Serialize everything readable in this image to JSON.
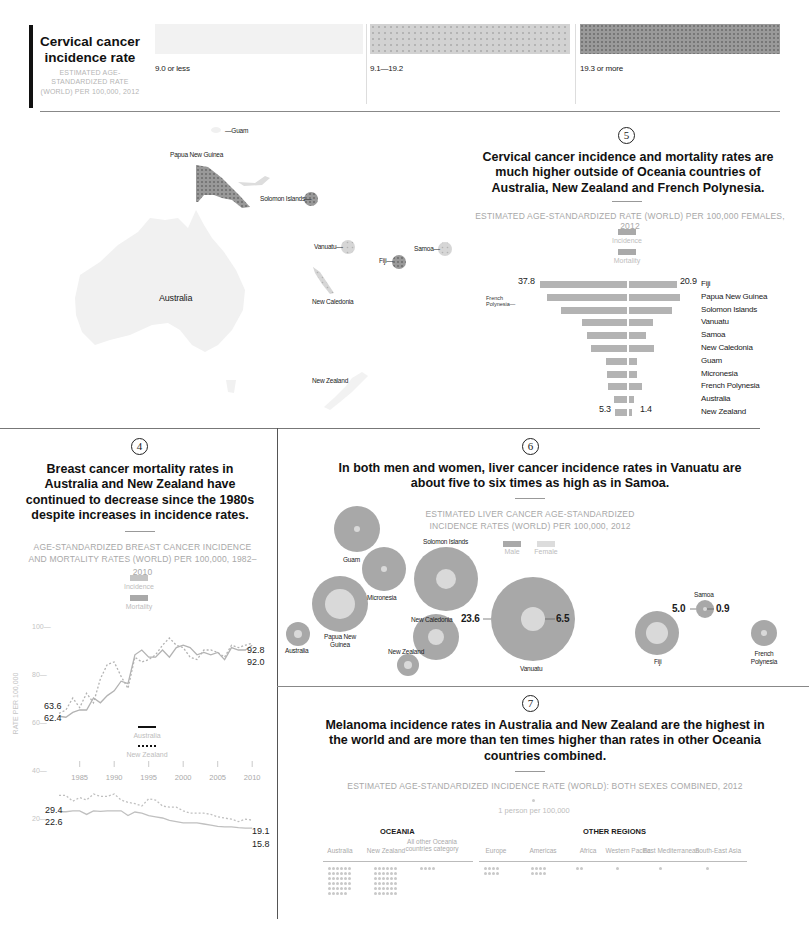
{
  "legend_top": {
    "title": "Cervical cancer incidence rate",
    "subtitle": "ESTIMATED AGE-STANDARDIZED RATE (WORLD) PER 100,000, 2012",
    "bins": [
      {
        "label": "9.0 or less",
        "color": "#f0f0f0"
      },
      {
        "label": "9.1—19.2",
        "color": "#cfcfcf"
      },
      {
        "label": "19.3 or more",
        "color": "#8c8c8c"
      }
    ]
  },
  "map": {
    "labels": {
      "guam": "—Guam",
      "png": "Papua New Guinea",
      "solomon": "Solomon Islands—",
      "vanuatu": "Vanuatu—",
      "fiji": "Fiji—",
      "samoa": "Samoa—",
      "new_caledonia": "New Caledonia",
      "australia": "Australia",
      "new_zealand": "New Zealand"
    }
  },
  "section5": {
    "number": "5",
    "headline": "Cervical cancer incidence and mortality rates are much higher outside of Oceania countries of Australia, New Zealand and French Polynesia.",
    "subtitle": "ESTIMATED AGE-STANDARDIZED RATE (WORLD) PER 100,000 FEMALES, 2012",
    "legend": [
      "Incidence",
      "Mortality"
    ],
    "french_polynesia_callout": "French Polynesia—",
    "labels": {
      "top_left": "37.8",
      "top_right": "20.9",
      "bottom_left": "5.3",
      "bottom_right": "1.4"
    }
  },
  "section4": {
    "number": "4",
    "headline": "Breast cancer mortality rates in Australia and New Zealand have continued to decrease since the 1980s despite increases in incidence rates.",
    "subtitle": "AGE-STANDARDIZED BREAST CANCER INCIDENCE AND MORTALITY RATES (WORLD) PER 100,000, 1982–2010",
    "legend": [
      "Incidence",
      "Mortality"
    ],
    "line_legend": [
      "Australia",
      "New Zealand"
    ],
    "ylabel": "RATE PER 100,000",
    "yticks": [
      "100—",
      "80—",
      "60—",
      "40—",
      "20—"
    ],
    "xticks": [
      "1985",
      "1990",
      "1995",
      "2000",
      "2005",
      "2010"
    ],
    "annotations": {
      "inc_nz_start": "63.6",
      "inc_au_start": "62.4",
      "inc_end_1": "92.8",
      "inc_end_2": "92.0",
      "mort_nz_start": "29.4",
      "mort_au_start": "22.6",
      "mort_nz_end": "19.1",
      "mort_au_end": "15.8"
    }
  },
  "section6": {
    "number": "6",
    "headline": "In both men and women, liver cancer incidence rates in Vanuatu are about five to  six times as high as in Samoa.",
    "subtitle": "ESTIMATED LIVER CANCER AGE-STANDARDIZED INCIDENCE RATES (WORLD) PER 100,000, 2012",
    "legend": [
      "Male",
      "Female"
    ],
    "labels": {
      "guam": "Guam",
      "micronesia": "Micronesia",
      "png": "Papua New Guinea",
      "australia": "Australia",
      "solomon": "Solomon Islands",
      "new_caledonia": "New Caledonia",
      "new_zealand": "New Zealand",
      "vanuatu": "Vanuatu",
      "fiji": "Fiji",
      "samoa": "Samoa",
      "french_polynesia": "French Polynesia",
      "vanuatu_male": "23.6",
      "vanuatu_female": "6.5",
      "samoa_male": "5.0",
      "samoa_female": "0.9"
    }
  },
  "section7": {
    "number": "7",
    "headline": "Melanoma incidence rates in Australia and New Zealand are the highest in the world and are more than ten times higher than rates in other Oceania countries combined.",
    "subtitle": "ESTIMATED AGE-STANDARDIZED INCIDENCE RATE (WORLD): BOTH SEXES COMBINED, 2012",
    "unit": "1 person per 100,000",
    "group_oceania": "OCEANIA",
    "group_other": "OTHER REGIONS",
    "columns": [
      "Australia",
      "New Zealand",
      "All other Oceania countries category",
      "Europe",
      "Americas",
      "Africa",
      "Western Pacific",
      "East Mediterranean",
      "South-East Asia"
    ]
  },
  "chart_data": [
    {
      "type": "bar",
      "title": "Cervical cancer incidence and mortality rates (per 100,000 females, 2012)",
      "categories": [
        "Fiji",
        "Papua New Guinea",
        "Solomon Islands",
        "Vanuatu",
        "Samoa",
        "New Caledonia",
        "Guam",
        "Micronesia",
        "French Polynesia",
        "Australia",
        "New Zealand"
      ],
      "series": [
        {
          "name": "Incidence",
          "values": [
            37.8,
            34.8,
            28.7,
            19.6,
            17.4,
            15.7,
            9.1,
            8.7,
            8.3,
            5.7,
            5.3
          ]
        },
        {
          "name": "Mortality",
          "values": [
            20.9,
            22.0,
            18.7,
            10.4,
            7.4,
            10.9,
            3.5,
            3.5,
            5.7,
            2.2,
            1.4
          ]
        }
      ]
    },
    {
      "type": "line",
      "title": "Breast cancer incidence and mortality, 1982–2010",
      "ylabel": "RATE PER 100,000",
      "x": [
        1982,
        1983,
        1984,
        1985,
        1986,
        1987,
        1988,
        1989,
        1990,
        1991,
        1992,
        1993,
        1994,
        1995,
        1996,
        1997,
        1998,
        1999,
        2000,
        2001,
        2002,
        2003,
        2004,
        2005,
        2006,
        2007,
        2008,
        2009,
        2010
      ],
      "ylim": [
        15,
        100
      ],
      "series": [
        {
          "name": "Australia incidence",
          "values": [
            62.4,
            62,
            64,
            65,
            65,
            70,
            68,
            71,
            73,
            77,
            76,
            88,
            90,
            87,
            87,
            90,
            87,
            91,
            92,
            91,
            88,
            89,
            88,
            89,
            86,
            91,
            90,
            90,
            92.0
          ]
        },
        {
          "name": "New Zealand incidence",
          "values": [
            63.6,
            65,
            70,
            66,
            72,
            68,
            78,
            84,
            85,
            79,
            74,
            87,
            85,
            86,
            88,
            92,
            95,
            92,
            91,
            87,
            86,
            90,
            90,
            89,
            87,
            92,
            91,
            92,
            92.8
          ]
        },
        {
          "name": "Australia mortality",
          "values": [
            22.6,
            22.6,
            23,
            23,
            21.5,
            23,
            22.8,
            23,
            23,
            23,
            21,
            22.5,
            22,
            21,
            20.5,
            20,
            19,
            18.5,
            18,
            18,
            18,
            17.5,
            17,
            16.5,
            16.3,
            16.3,
            16,
            15.8,
            15.8
          ]
        },
        {
          "name": "New Zealand mortality",
          "values": [
            29.4,
            29.4,
            27,
            28.5,
            27.5,
            30,
            29,
            29,
            30,
            27.5,
            26.5,
            26,
            25,
            28,
            27.5,
            25,
            24.5,
            24.5,
            23,
            22,
            22,
            22,
            21.5,
            20.5,
            20,
            19.5,
            18.5,
            19.5,
            19.1
          ]
        }
      ],
      "xticks": [
        1985,
        1990,
        1995,
        2000,
        2005,
        2010
      ],
      "yticks": [
        20,
        40,
        60,
        80,
        100
      ]
    },
    {
      "type": "scatter",
      "title": "Liver cancer incidence rates per 100,000, 2012 (bubble: outer=male, inner=female)",
      "categories": [
        "Guam",
        "Micronesia",
        "Papua New Guinea",
        "Australia",
        "Solomon Islands",
        "New Caledonia",
        "New Zealand",
        "Vanuatu",
        "Fiji",
        "Samoa",
        "French Polynesia"
      ],
      "series": [
        {
          "name": "Male",
          "values": [
            12,
            11,
            15,
            3.5,
            20,
            10,
            2.7,
            23.6,
            9,
            5.0,
            4.5
          ]
        },
        {
          "name": "Female",
          "values": [
            0.5,
            0.5,
            4.5,
            0.8,
            2.2,
            1.6,
            0.8,
            6.5,
            2.4,
            0.9,
            0.6
          ]
        }
      ]
    },
    {
      "type": "bar",
      "title": "Melanoma incidence rate, both sexes, 2012 (1 dot = 1 person per 100,000)",
      "categories": [
        "Australia",
        "New Zealand",
        "All other Oceania countries category",
        "Europe",
        "Americas",
        "Africa",
        "Western Pacific",
        "East Mediterranean",
        "South-East Asia"
      ],
      "values": [
        35,
        36,
        3.5,
        7.5,
        7.5,
        1.5,
        1.2,
        0.5,
        0.5
      ]
    }
  ]
}
